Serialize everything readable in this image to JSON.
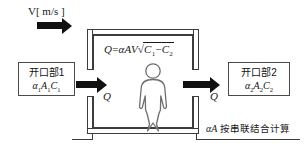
{
  "diagram": {
    "title_none": "",
    "wind_label": "V[ m/s ]",
    "formula": {
      "lhs": "Q",
      "eq": "=",
      "alpha_a_v": "αAV",
      "radical_prefix": "√",
      "c1": "C",
      "c1_sub": "1",
      "minus": "−",
      "c2": "C",
      "c2_sub": "2",
      "full_text": "Q=αAV√(C₁−C₂)"
    },
    "flow_label_left": "Q",
    "flow_label_right": "Q",
    "note": {
      "symbol": "αA",
      "text": " 按串联结合计算",
      "full_text": "αA 按串联结合计算"
    },
    "openings": [
      {
        "id": "opening-1",
        "title": "开口部1",
        "symbol_alpha": "α",
        "symbol_alpha_sub": "1",
        "symbol_a": "A",
        "symbol_a_sub": "1",
        "symbol_c": "C",
        "symbol_c_sub": "1",
        "symbol_full": "α₁A₁C₁"
      },
      {
        "id": "opening-2",
        "title": "开口部2",
        "symbol_alpha": "α",
        "symbol_alpha_sub": "2",
        "symbol_a": "A",
        "symbol_a_sub": "2",
        "symbol_c": "C",
        "symbol_c_sub": "2",
        "symbol_full": "α₂A₂C₂"
      }
    ],
    "arrows": [
      {
        "id": "wind-inlet-arrow",
        "direction": "right"
      },
      {
        "id": "flow-in-arrow",
        "direction": "right"
      },
      {
        "id": "flow-out-arrow",
        "direction": "right"
      }
    ],
    "figure": {
      "id": "person-figure",
      "description": "person"
    },
    "colors": {
      "line": "#3c3c3c",
      "arrow": "#111111",
      "text": "#1a1a1a",
      "background": "#ffffff",
      "person_stroke": "#6e6e6e"
    }
  }
}
